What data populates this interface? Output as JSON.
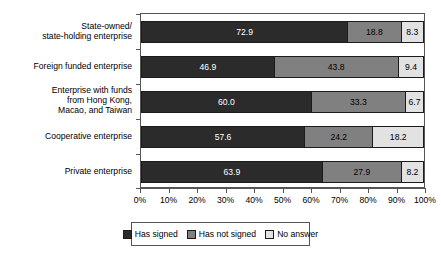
{
  "chart_data": {
    "type": "bar",
    "subtype": "horizontal-100-percent-stacked",
    "title": "",
    "xlabel": "",
    "ylabel": "",
    "xlim": [
      0,
      100
    ],
    "grid": false,
    "legend_position": "bottom",
    "categories": [
      "State-owned/\nstate-holding enterprise",
      "Foreign funded enterprise",
      "Enterprise with funds\nfrom Hong Kong,\nMacao, and Taiwan",
      "Cooperative enterprise",
      "Private enterprise"
    ],
    "category_lines": [
      [
        "State-owned/",
        "state-holding enterprise"
      ],
      [
        "Foreign funded enterprise"
      ],
      [
        "Enterprise with funds",
        "from Hong Kong,",
        "Macao, and Taiwan"
      ],
      [
        "Cooperative enterprise"
      ],
      [
        "Private enterprise"
      ]
    ],
    "series": [
      {
        "name": "Has signed",
        "color": "#2b2b2b",
        "values": [
          72.9,
          46.9,
          60.0,
          57.6,
          63.9
        ]
      },
      {
        "name": "Has not signed",
        "color": "#808080",
        "values": [
          18.8,
          43.8,
          33.3,
          24.2,
          27.9
        ]
      },
      {
        "name": "No answer",
        "color": "#e2e2e2",
        "values": [
          8.3,
          9.4,
          6.7,
          18.2,
          8.2
        ]
      }
    ],
    "value_labels": [
      [
        "72.9",
        "18.8",
        "8.3"
      ],
      [
        "46.9",
        "43.8",
        "9.4"
      ],
      [
        "60.0",
        "33.3",
        "6.7"
      ],
      [
        "57.6",
        "24.2",
        "18.2"
      ],
      [
        "63.9",
        "27.9",
        "8.2"
      ]
    ],
    "xticks": [
      0,
      10,
      20,
      30,
      40,
      50,
      60,
      70,
      80,
      90,
      100
    ],
    "xtick_labels": [
      "0%",
      "10%",
      "20%",
      "30%",
      "40%",
      "50%",
      "60%",
      "70%",
      "80%",
      "90%",
      "100%"
    ]
  }
}
